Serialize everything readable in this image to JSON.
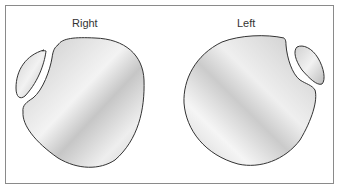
{
  "diagram": {
    "labels": {
      "right": "Right",
      "left": "Left"
    },
    "colors": {
      "outline": "#333333",
      "fill_light": "#f4f4f4",
      "fill_mid": "#d8d8d8",
      "fill_dark": "#bdbdbd",
      "frame": "#8a8a8a"
    }
  }
}
